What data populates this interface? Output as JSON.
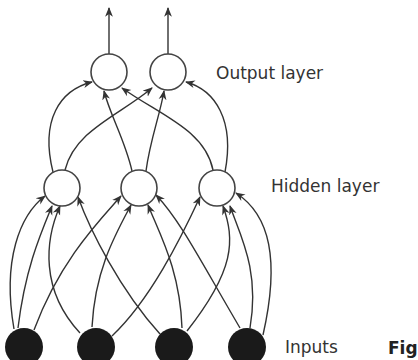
{
  "diagram": {
    "type": "feedforward-neural-network",
    "layers": [
      {
        "name": "output",
        "label": "Output layer",
        "node_count": 2,
        "fill": "#ffffff"
      },
      {
        "name": "hidden",
        "label": "Hidden layer",
        "node_count": 3,
        "fill": "#ffffff"
      },
      {
        "name": "input",
        "label": "Inputs",
        "node_count": 4,
        "fill": "#1a1a1a"
      }
    ],
    "connections": "fully-connected input→hidden, hidden→output, arrows on outputs",
    "caption_fragment": "Fig"
  },
  "colors": {
    "stroke": "#333333",
    "input_fill": "#1a1a1a",
    "background": "#ffffff"
  }
}
